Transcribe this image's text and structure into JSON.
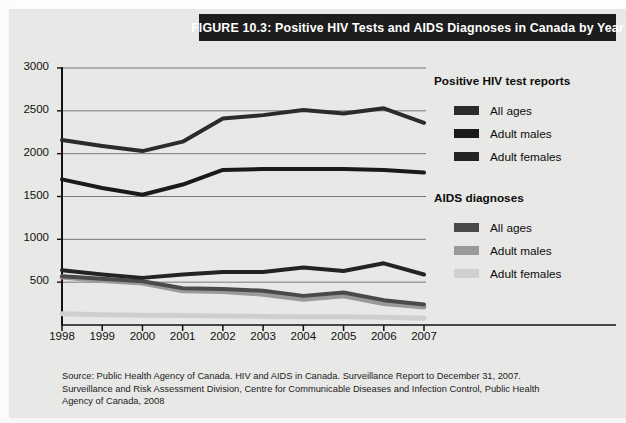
{
  "figure": {
    "title": "FIGURE 10.3: Positive HIV Tests and AIDS Diagnoses in Canada by Year"
  },
  "legend": {
    "group1_heading": "Positive HIV test reports",
    "group2_heading": "AIDS diagnoses",
    "group1_items": [
      {
        "label": "All ages",
        "color": "#2b2b2b"
      },
      {
        "label": "Adult males",
        "color": "#1a1a1a"
      },
      {
        "label": "Adult females",
        "color": "#232323"
      }
    ],
    "group2_items": [
      {
        "label": "All ages",
        "color": "#4a4a4a"
      },
      {
        "label": "Adult males",
        "color": "#9a9a9a"
      },
      {
        "label": "Adult females",
        "color": "#cfcfcf"
      }
    ]
  },
  "source": {
    "line1": "Source: Public Health Agency of Canada. HIV and AIDS in Canada. Surveillance Report to December 31, 2007.",
    "line2": "Surveillance and Risk Assessment Division, Centre for Communicable Diseases and Infection Control, Public Health",
    "line3": "Agency of Canada, 2008"
  },
  "chart_data": {
    "type": "line",
    "title": "FIGURE 10.3: Positive HIV Tests and AIDS Diagnoses in Canada by Year",
    "xlabel": "",
    "ylabel": "",
    "x": [
      "1998",
      "1999",
      "2000",
      "2001",
      "2002",
      "2003",
      "2004",
      "2005",
      "2006",
      "2007"
    ],
    "categories": [
      "1998",
      "1999",
      "2000",
      "2001",
      "2002",
      "2003",
      "2004",
      "2005",
      "2006",
      "2007"
    ],
    "ylim": [
      0,
      3000
    ],
    "yticks": [
      0,
      500,
      1000,
      1500,
      2000,
      2500,
      3000
    ],
    "ytick_labels": [
      "",
      "500",
      "1000",
      "1500",
      "2000",
      "2500",
      "3000"
    ],
    "grid": "horizontal",
    "legend_position": "right",
    "series": [
      {
        "name": "Positive HIV test reports - All ages",
        "group": "Positive HIV test reports",
        "color": "#2b2b2b",
        "width": 4,
        "values": [
          2160,
          2090,
          2030,
          2140,
          2410,
          2450,
          2510,
          2470,
          2530,
          2360
        ]
      },
      {
        "name": "Positive HIV test reports - Adult males",
        "group": "Positive HIV test reports",
        "color": "#1a1a1a",
        "width": 4,
        "values": [
          1700,
          1600,
          1520,
          1640,
          1810,
          1820,
          1820,
          1820,
          1810,
          1780
        ]
      },
      {
        "name": "Positive HIV test reports - Adult females",
        "group": "Positive HIV test reports",
        "color": "#232323",
        "width": 4,
        "values": [
          640,
          590,
          550,
          590,
          620,
          620,
          670,
          630,
          720,
          590
        ]
      },
      {
        "name": "AIDS diagnoses - All ages",
        "group": "AIDS diagnoses",
        "color": "#4a4a4a",
        "width": 4,
        "values": [
          570,
          540,
          510,
          430,
          420,
          400,
          340,
          380,
          290,
          240
        ]
      },
      {
        "name": "AIDS diagnoses - Adult males",
        "group": "AIDS diagnoses",
        "color": "#9a9a9a",
        "width": 5,
        "values": [
          560,
          520,
          490,
          400,
          390,
          360,
          300,
          340,
          250,
          210
        ]
      },
      {
        "name": "AIDS diagnoses - Adult females",
        "group": "AIDS diagnoses",
        "color": "#cfcfcf",
        "width": 5,
        "values": [
          130,
          120,
          115,
          110,
          105,
          100,
          95,
          95,
          90,
          80
        ]
      }
    ]
  }
}
